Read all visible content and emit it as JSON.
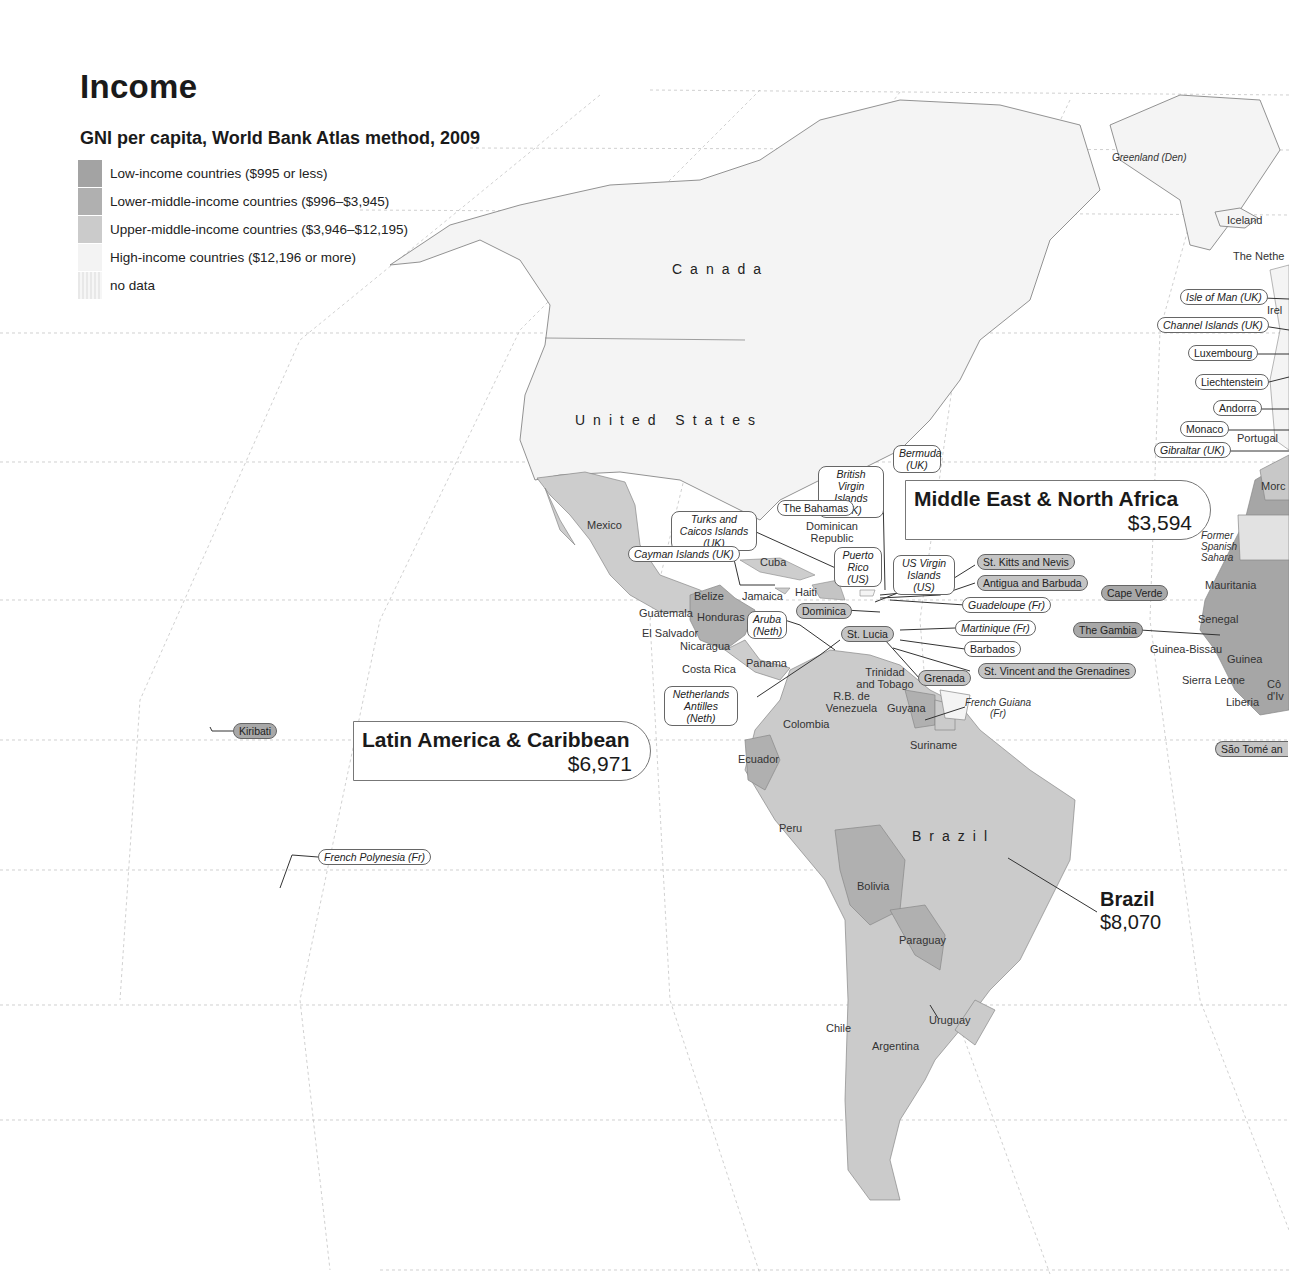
{
  "header": {
    "title": "Income",
    "subtitle": "GNI per capita, World Bank Atlas method, 2009"
  },
  "legend": [
    {
      "label": "Low-income countries ($995 or less)",
      "color": "#a3a3a3"
    },
    {
      "label": "Lower-middle-income countries ($996–$3,945)",
      "color": "#b0b0b0"
    },
    {
      "label": "Upper-middle-income countries ($3,946–$12,195)",
      "color": "#cbcbcb"
    },
    {
      "label": "High-income countries ($12,196 or more)",
      "color": "#f3f3f3"
    },
    {
      "label": "no data",
      "color": "#e6e6e6"
    }
  ],
  "regions": {
    "mena": {
      "name": "Middle East & North Africa",
      "value": "$3,594"
    },
    "lac": {
      "name": "Latin America & Caribbean",
      "value": "$6,971"
    },
    "brazil": {
      "name": "Brazil",
      "value": "$8,070"
    }
  },
  "country_labels": {
    "canada": "Canada",
    "united_states": "United States",
    "brazil": "Brazil",
    "greenland": "Greenland (Den)",
    "iceland": "Iceland",
    "netherlands": "The Nethe",
    "ireland": "Irel",
    "portugal": "Portugal",
    "morocco": "Morc",
    "former_spanish_sahara": "Former Spanish Sahara",
    "mauritania": "Mauritania",
    "senegal": "Senegal",
    "guinea_bissau": "Guinea-Bissau",
    "guinea": "Guinea",
    "sierra_leone": "Sierra Leone",
    "liberia": "Liberia",
    "cote_divoire": "Cô d'Iv",
    "mexico": "Mexico",
    "cuba": "Cuba",
    "jamaica": "Jamaica",
    "haiti": "Haiti",
    "dominican_republic": "Dominican Republic",
    "belize": "Belize",
    "guatemala": "Guatemala",
    "honduras": "Honduras",
    "el_salvador": "El Salvador",
    "nicaragua": "Nicaragua",
    "costa_rica": "Costa Rica",
    "panama": "Panama",
    "trinidad": "Trinidad and Tobago",
    "venezuela": "R.B. de Venezuela",
    "guyana": "Guyana",
    "suriname": "Suriname",
    "french_guiana": "French Guiana (Fr)",
    "colombia": "Colombia",
    "ecuador": "Ecuador",
    "peru": "Peru",
    "bolivia": "Bolivia",
    "paraguay": "Paraguay",
    "chile": "Chile",
    "argentina": "Argentina",
    "uruguay": "Uruguay"
  },
  "callout_tags": {
    "isle_of_man": "Isle of Man (UK)",
    "channel_islands": "Channel Islands (UK)",
    "luxembourg": "Luxembourg",
    "liechtenstein": "Liechtenstein",
    "andorra": "Andorra",
    "monaco": "Monaco",
    "gibraltar": "Gibraltar (UK)",
    "bermuda": "Bermuda (UK)",
    "bvi": "British Virgin Islands (UK)",
    "bahamas": "The Bahamas",
    "turks_caicos": "Turks and Caicos Islands (UK)",
    "cayman": "Cayman Islands (UK)",
    "puerto_rico": "Puerto Rico (US)",
    "usvi": "US Virgin Islands (US)",
    "st_kitts": "St. Kitts and Nevis",
    "antigua": "Antigua and Barbuda",
    "cape_verde": "Cape Verde",
    "guadeloupe": "Guadeloupe (Fr)",
    "martinique": "Martinique (Fr)",
    "the_gambia": "The Gambia",
    "barbados": "Barbados",
    "st_vincent": "St. Vincent and the Grenadines",
    "grenada": "Grenada",
    "dominica": "Dominica",
    "st_lucia": "St. Lucia",
    "aruba": "Aruba (Neth)",
    "netherlands_antilles": "Netherlands Antilles (Neth)",
    "kiribati": "Kiribati",
    "french_polynesia": "French Polynesia (Fr)",
    "sao_tome": "São Tomé an"
  }
}
